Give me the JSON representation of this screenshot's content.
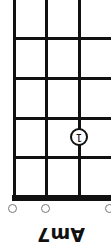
{
  "chord": {
    "name": "Am7",
    "orientation": "rotated-180",
    "finger": {
      "label": "1",
      "string_x": 78,
      "fret_y": 137
    },
    "open_strings": [
      {
        "x": 12
      },
      {
        "x": 45
      },
      {
        "x": 108
      }
    ]
  },
  "colors": {
    "line": "#111111",
    "background": "#ffffff",
    "open_circle": "#777777"
  }
}
